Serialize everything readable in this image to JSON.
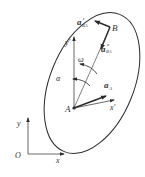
{
  "diagram": {
    "type": "rigid-body-acceleration",
    "labels": {
      "point_A": "A",
      "point_B": "B",
      "moving_x": "x'",
      "moving_y": "y'",
      "fixed_origin": "O",
      "fixed_x": "x",
      "fixed_y": "y",
      "omega": "ω",
      "alpha": "α",
      "a_A_main": "a",
      "a_A_sub": "A",
      "a_tBA_main": "a",
      "a_tBA_sup": "t",
      "a_tBA_sub": "BA",
      "a_nBA_main": "a",
      "a_nBA_sup": "n",
      "a_nBA_sub": "BA"
    },
    "colors": {
      "stroke": "#2a2a2a",
      "text": "#333333",
      "background": "#ffffff"
    }
  }
}
